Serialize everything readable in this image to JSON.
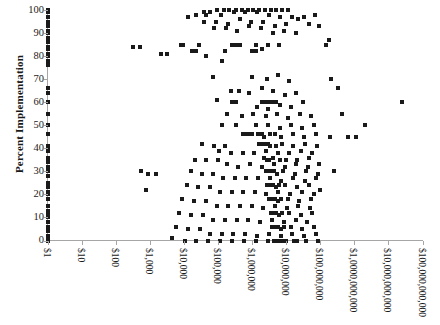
{
  "chart_data": {
    "type": "scatter",
    "title": "",
    "xlabel": "",
    "ylabel": "Percent Implementation",
    "grid": false,
    "legend": false,
    "xscale": "log",
    "yscale": "linear",
    "ylim": [
      0,
      100
    ],
    "xlim": [
      1,
      100000000000
    ],
    "ytick_labels": [
      "100",
      "90",
      "80",
      "70",
      "60",
      "50",
      "40",
      "30",
      "20",
      "10",
      "0"
    ],
    "ytick_values": [
      100,
      90,
      80,
      70,
      60,
      50,
      40,
      30,
      20,
      10,
      0
    ],
    "xtick_labels": [
      "$1",
      "$10",
      "$100",
      "$1,000",
      "$10,000",
      "$100,000",
      "$1,000,000",
      "$10,000,000",
      "$100,000,000",
      "$1,0000,000,000",
      "$10,000,000,000",
      "$100,000,000,000"
    ],
    "xtick_values": [
      1,
      10,
      100,
      1000,
      10000,
      100000,
      1000000,
      10000000,
      100000000,
      1000000000,
      10000000000,
      100000000000
    ],
    "marker": "square",
    "marker_color": "#1a1a1a",
    "marker_size": 4,
    "points": [
      [
        1,
        100
      ],
      [
        1,
        99
      ],
      [
        1,
        97
      ],
      [
        1,
        95
      ],
      [
        1,
        93
      ],
      [
        1,
        91
      ],
      [
        1,
        90
      ],
      [
        1,
        88
      ],
      [
        1,
        86
      ],
      [
        1,
        84
      ],
      [
        1,
        83
      ],
      [
        1,
        81
      ],
      [
        1,
        80
      ],
      [
        1,
        78
      ],
      [
        1,
        76
      ],
      [
        1,
        66
      ],
      [
        1,
        64
      ],
      [
        1,
        60
      ],
      [
        1,
        55
      ],
      [
        1,
        50
      ],
      [
        1,
        46
      ],
      [
        1,
        41
      ],
      [
        1,
        40
      ],
      [
        1,
        39
      ],
      [
        1,
        36
      ],
      [
        1,
        34
      ],
      [
        1,
        32
      ],
      [
        1,
        30
      ],
      [
        1,
        28
      ],
      [
        1,
        25
      ],
      [
        1,
        23
      ],
      [
        1,
        21
      ],
      [
        1,
        20
      ],
      [
        1,
        18
      ],
      [
        1,
        15
      ],
      [
        1,
        13
      ],
      [
        1,
        12
      ],
      [
        1,
        10
      ],
      [
        1,
        8
      ],
      [
        1,
        6
      ],
      [
        1,
        4
      ],
      [
        1,
        2
      ],
      [
        1,
        1
      ],
      [
        1,
        0
      ],
      [
        330,
        84
      ],
      [
        520,
        84
      ],
      [
        2100,
        81
      ],
      [
        3300,
        81
      ],
      [
        560,
        30
      ],
      [
        900,
        29
      ],
      [
        1500,
        29
      ],
      [
        760,
        22
      ],
      [
        13000,
        97
      ],
      [
        40000,
        99
      ],
      [
        60000,
        99
      ],
      [
        95000,
        100
      ],
      [
        150000,
        100
      ],
      [
        210000,
        100
      ],
      [
        330000,
        100
      ],
      [
        520000,
        100
      ],
      [
        760000,
        100
      ],
      [
        1100000,
        100
      ],
      [
        1600000,
        100
      ],
      [
        2400000,
        100
      ],
      [
        3600000,
        100
      ],
      [
        5200000,
        100
      ],
      [
        7600000,
        100
      ],
      [
        11000000,
        100
      ],
      [
        23000,
        98
      ],
      [
        46000,
        98
      ],
      [
        125000,
        98
      ],
      [
        290000,
        99
      ],
      [
        640000,
        99
      ],
      [
        1400000,
        99
      ],
      [
        3100000,
        98
      ],
      [
        6800000,
        97
      ],
      [
        15000000,
        97
      ],
      [
        33000000,
        97
      ],
      [
        72000000,
        98
      ],
      [
        38000,
        95
      ],
      [
        88000,
        95
      ],
      [
        195000,
        94
      ],
      [
        430000,
        96
      ],
      [
        960000,
        95
      ],
      [
        2100000,
        95
      ],
      [
        4700000,
        93
      ],
      [
        10000000,
        94
      ],
      [
        22000000,
        96
      ],
      [
        48000000,
        94
      ],
      [
        77000,
        92
      ],
      [
        170000,
        92
      ],
      [
        370000,
        91
      ],
      [
        820000,
        93
      ],
      [
        1800000,
        92
      ],
      [
        4000000,
        90
      ],
      [
        8800000,
        91
      ],
      [
        19000000,
        90
      ],
      [
        95000000,
        93
      ],
      [
        8000,
        85
      ],
      [
        9500,
        85
      ],
      [
        27000,
        85
      ],
      [
        250000,
        85
      ],
      [
        330000,
        85
      ],
      [
        430000,
        85
      ],
      [
        1300000,
        85
      ],
      [
        2900000,
        85
      ],
      [
        6300000,
        85
      ],
      [
        17000,
        82
      ],
      [
        22000,
        82
      ],
      [
        160000,
        82
      ],
      [
        1000000,
        82
      ],
      [
        1150000,
        82
      ],
      [
        1300000,
        82
      ],
      [
        2000000,
        83
      ],
      [
        44000,
        80
      ],
      [
        130000,
        78
      ],
      [
        70000,
        71
      ],
      [
        1000000,
        71
      ],
      [
        2700000,
        70
      ],
      [
        5900000,
        72
      ],
      [
        12000000,
        69
      ],
      [
        240000,
        65
      ],
      [
        420000,
        65
      ],
      [
        820000,
        64
      ],
      [
        1900000,
        66
      ],
      [
        4200000,
        65
      ],
      [
        9000000,
        63
      ],
      [
        20000000,
        64
      ],
      [
        95000,
        61
      ],
      [
        260000,
        60
      ],
      [
        340000,
        60
      ],
      [
        2000000,
        60
      ],
      [
        2400000,
        60
      ],
      [
        2900000,
        60
      ],
      [
        3500000,
        60
      ],
      [
        4200000,
        60
      ],
      [
        5100000,
        60
      ],
      [
        1400000,
        58
      ],
      [
        3000000,
        57
      ],
      [
        6600000,
        59
      ],
      [
        14000000,
        58
      ],
      [
        31000000,
        60
      ],
      [
        190000,
        55
      ],
      [
        510000,
        54
      ],
      [
        1100000,
        55
      ],
      [
        2500000,
        54
      ],
      [
        5400000,
        55
      ],
      [
        11500000,
        53
      ],
      [
        25000000,
        55
      ],
      [
        55000000,
        54
      ],
      [
        130000,
        50
      ],
      [
        330000,
        50
      ],
      [
        1300000,
        50
      ],
      [
        2900000,
        50
      ],
      [
        6400000,
        49
      ],
      [
        14000000,
        50
      ],
      [
        30000000,
        49
      ],
      [
        66000000,
        50
      ],
      [
        2000000000,
        50
      ],
      [
        560000,
        46
      ],
      [
        680000,
        46
      ],
      [
        810000,
        46
      ],
      [
        980000,
        46
      ],
      [
        1500000,
        46
      ],
      [
        1900000,
        46
      ],
      [
        2300000,
        45
      ],
      [
        3300000,
        46
      ],
      [
        4800000,
        46
      ],
      [
        7100000,
        45
      ],
      [
        15500000,
        46
      ],
      [
        34000000,
        45
      ],
      [
        75000000,
        46
      ],
      [
        35000,
        42
      ],
      [
        75000,
        41
      ],
      [
        165000,
        41
      ],
      [
        1600000,
        42
      ],
      [
        1950000,
        42
      ],
      [
        2350000,
        42
      ],
      [
        2850000,
        42
      ],
      [
        3400000,
        41
      ],
      [
        5000000,
        41
      ],
      [
        7400000,
        42
      ],
      [
        16000000,
        41
      ],
      [
        36000000,
        42
      ],
      [
        79000000,
        41
      ],
      [
        110000,
        39
      ],
      [
        240000,
        38
      ],
      [
        530000,
        38
      ],
      [
        1150000,
        38
      ],
      [
        2600000,
        39
      ],
      [
        5700000,
        38
      ],
      [
        12500000,
        38
      ],
      [
        27000000,
        39
      ],
      [
        59000000,
        38
      ],
      [
        21000,
        35
      ],
      [
        46000,
        35
      ],
      [
        100000,
        35
      ],
      [
        2200000,
        36
      ],
      [
        2700000,
        35
      ],
      [
        3200000,
        35
      ],
      [
        4000000,
        36
      ],
      [
        6500000,
        35
      ],
      [
        9700000,
        35
      ],
      [
        21000000,
        35
      ],
      [
        46000000,
        36
      ],
      [
        185000,
        33
      ],
      [
        400000,
        32
      ],
      [
        870000,
        33
      ],
      [
        1900000,
        32
      ],
      [
        4300000,
        33
      ],
      [
        9200000,
        32
      ],
      [
        20000000,
        33
      ],
      [
        43000000,
        32
      ],
      [
        92000000,
        33
      ],
      [
        16000,
        30
      ],
      [
        33000,
        29
      ],
      [
        72000,
        29
      ],
      [
        2500000,
        30
      ],
      [
        3000000,
        30
      ],
      [
        3700000,
        30
      ],
      [
        4500000,
        30
      ],
      [
        5500000,
        29
      ],
      [
        8200000,
        30
      ],
      [
        18000000,
        29
      ],
      [
        39000000,
        30
      ],
      [
        86000000,
        29
      ],
      [
        145000,
        27
      ],
      [
        310000,
        27
      ],
      [
        680000,
        27
      ],
      [
        1500000,
        27
      ],
      [
        3300000,
        27
      ],
      [
        7200000,
        26
      ],
      [
        16000000,
        27
      ],
      [
        35000000,
        26
      ],
      [
        77000000,
        27
      ],
      [
        12000,
        24
      ],
      [
        26000,
        23
      ],
      [
        57000,
        23
      ],
      [
        2800000,
        24
      ],
      [
        3400000,
        24
      ],
      [
        4100000,
        24
      ],
      [
        5000000,
        23
      ],
      [
        6200000,
        24
      ],
      [
        9500000,
        24
      ],
      [
        21000000,
        23
      ],
      [
        47000000,
        24
      ],
      [
        115000,
        21
      ],
      [
        250000,
        21
      ],
      [
        540000,
        21
      ],
      [
        1200000,
        21
      ],
      [
        2600000,
        20
      ],
      [
        5800000,
        21
      ],
      [
        13000000,
        20
      ],
      [
        29000000,
        21
      ],
      [
        64000000,
        20
      ],
      [
        9000,
        18
      ],
      [
        20000,
        17
      ],
      [
        44000,
        17
      ],
      [
        3100000,
        18
      ],
      [
        3800000,
        18
      ],
      [
        4600000,
        18
      ],
      [
        5600000,
        17
      ],
      [
        6900000,
        18
      ],
      [
        11000000,
        18
      ],
      [
        24000000,
        17
      ],
      [
        53000000,
        18
      ],
      [
        92000,
        15
      ],
      [
        200000,
        15
      ],
      [
        440000,
        15
      ],
      [
        970000,
        15
      ],
      [
        2100000,
        14
      ],
      [
        4700000,
        15
      ],
      [
        10500000,
        14
      ],
      [
        23000000,
        15
      ],
      [
        51000000,
        14
      ],
      [
        7200,
        12
      ],
      [
        16000,
        11
      ],
      [
        36000,
        11
      ],
      [
        3500000,
        12
      ],
      [
        4300000,
        12
      ],
      [
        5200000,
        12
      ],
      [
        6300000,
        11
      ],
      [
        7800000,
        12
      ],
      [
        12500000,
        12
      ],
      [
        27000000,
        11
      ],
      [
        59000000,
        12
      ],
      [
        74000,
        9
      ],
      [
        160000,
        9
      ],
      [
        350000,
        9
      ],
      [
        780000,
        9
      ],
      [
        1700000,
        8
      ],
      [
        3800000,
        9
      ],
      [
        8500000,
        8
      ],
      [
        19000000,
        9
      ],
      [
        41000000,
        8
      ],
      [
        5800,
        6
      ],
      [
        13000,
        5
      ],
      [
        29000,
        5
      ],
      [
        3900000,
        6
      ],
      [
        4800000,
        6
      ],
      [
        5800000,
        6
      ],
      [
        7000000,
        5
      ],
      [
        8700000,
        6
      ],
      [
        14000000,
        6
      ],
      [
        30000000,
        5
      ],
      [
        66000000,
        6
      ],
      [
        60000,
        3
      ],
      [
        130000,
        3
      ],
      [
        280000,
        3
      ],
      [
        630000,
        3
      ],
      [
        1400000,
        2
      ],
      [
        3100000,
        3
      ],
      [
        6900000,
        2
      ],
      [
        15000000,
        3
      ],
      [
        33000000,
        2
      ],
      [
        73000000,
        3
      ],
      [
        4600,
        1
      ],
      [
        10500,
        0
      ],
      [
        23000,
        0
      ],
      [
        52000,
        0
      ],
      [
        115000,
        0
      ],
      [
        260000,
        0
      ],
      [
        580000,
        0
      ],
      [
        1300000,
        0
      ],
      [
        2900000,
        0
      ],
      [
        4400000,
        0
      ],
      [
        5400000,
        0
      ],
      [
        6500000,
        0
      ],
      [
        7900000,
        0
      ],
      [
        9800000,
        0
      ],
      [
        17000000,
        0
      ],
      [
        21000000,
        0
      ],
      [
        38000000,
        0
      ],
      [
        85000000,
        0
      ],
      [
        210000000,
        70
      ],
      [
        330000000,
        66
      ],
      [
        150000000,
        85
      ],
      [
        175000000,
        87
      ],
      [
        450000000,
        55
      ],
      [
        25000000000,
        60
      ],
      [
        260000000,
        30
      ],
      [
        640000000,
        45
      ],
      [
        1100000000,
        45
      ],
      [
        190000000,
        45
      ],
      [
        98000000,
        22
      ]
    ]
  }
}
